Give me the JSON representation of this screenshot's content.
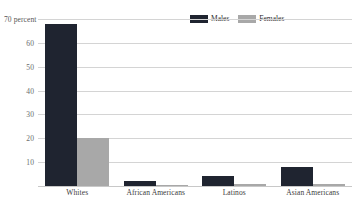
{
  "chart_data": {
    "type": "bar",
    "title": "",
    "subtitle": "",
    "xlabel": "",
    "ylabel": "",
    "axis_unit_label": "70 percent",
    "categories": [
      "Whites",
      "African Americans",
      "Latinos",
      "Asian Americans"
    ],
    "series": [
      {
        "name": "Males",
        "color": "#1f2430",
        "values": [
          68,
          2,
          4,
          8
        ]
      },
      {
        "name": "Females",
        "color": "#a8a8a8",
        "values": [
          20,
          0.6,
          0.8,
          1
        ]
      }
    ],
    "ylim": [
      0,
      70
    ],
    "yticks": [
      70,
      60,
      50,
      40,
      30,
      20,
      10
    ],
    "ytick_labels": [
      "70 percent",
      "60",
      "50",
      "40",
      "30",
      "20",
      "10"
    ],
    "grid": true,
    "legend_position": "top-right",
    "grid_color": "#d4d4d4",
    "background_color": "#ffffff"
  },
  "legend": {
    "males_label": "Males",
    "females_label": "Females"
  }
}
